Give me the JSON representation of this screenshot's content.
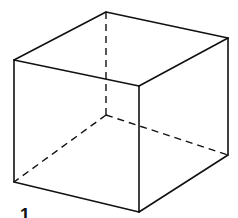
{
  "diagram": {
    "type": "wireframe-cube",
    "stroke_color": "#111111",
    "background": "#ffffff",
    "vertices": {
      "top_back": [
        106,
        12
      ],
      "top_right": [
        228,
        38
      ],
      "front_top_left": [
        14,
        60
      ],
      "front_top_right": [
        139,
        86
      ],
      "back_bottom": [
        106,
        115
      ],
      "right_bottom": [
        228,
        155
      ],
      "front_bottom_left": [
        14,
        182
      ],
      "front_bottom_right": [
        139,
        212
      ]
    },
    "hidden_edges_style": "dashed",
    "visible_edges_style": "solid"
  },
  "label": {
    "text": "1"
  }
}
